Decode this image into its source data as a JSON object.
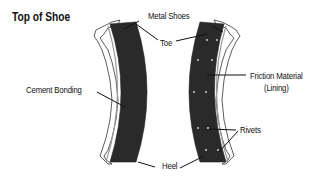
{
  "diagram": {
    "title": "Top of Shoe",
    "labels": {
      "metal_shoes": "Metal Shoes",
      "toe": "Toe",
      "friction_material": "Friction Material",
      "lining": "(Lining)",
      "cement_bonding": "Cement Bonding",
      "rivets": "Rivets",
      "heel": "Heel"
    },
    "colors": {
      "lining": "#2a2a2a",
      "shoe_metal": "#ffffff",
      "outline": "#333333",
      "leader_line": "#111111"
    }
  }
}
